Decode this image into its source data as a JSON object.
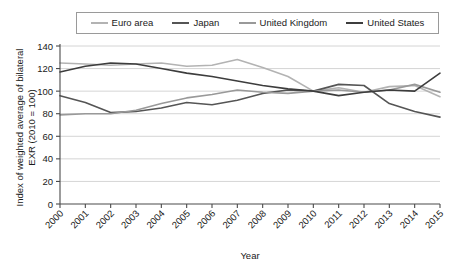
{
  "chart_data": {
    "type": "line",
    "title": "",
    "xlabel": "Year",
    "ylabel": "Index of weighted average of bilateral EXR (2010 = 100)",
    "x": [
      2000,
      2001,
      2002,
      2003,
      2004,
      2005,
      2006,
      2007,
      2008,
      2009,
      2010,
      2011,
      2012,
      2013,
      2014,
      2015
    ],
    "xtick_labels": [
      "2000",
      "2001",
      "2002",
      "2003",
      "2004",
      "2005",
      "2006",
      "2007",
      "2008",
      "2009",
      "2010",
      "2011",
      "2012",
      "2013",
      "2014",
      "2015"
    ],
    "ytick_labels": [
      "0",
      "20",
      "40",
      "60",
      "80",
      "100",
      "120",
      "140"
    ],
    "yticks": [
      0,
      20,
      40,
      60,
      80,
      100,
      120,
      140
    ],
    "ylim": [
      0,
      140
    ],
    "xlim": [
      2000,
      2015
    ],
    "grid": "horizontal",
    "legend_position": "top",
    "series": [
      {
        "name": "Euro area",
        "color": "#b3b3b3",
        "values": [
          125,
          124,
          123,
          124,
          125,
          122,
          123,
          128,
          121,
          113,
          100,
          103,
          99,
          104,
          105,
          95
        ]
      },
      {
        "name": "Japan",
        "color": "#555555",
        "values": [
          96,
          90,
          81,
          82,
          85,
          90,
          88,
          92,
          98,
          101,
          100,
          106,
          105,
          89,
          82,
          77
        ]
      },
      {
        "name": "United Kingdom",
        "color": "#999999",
        "values": [
          79,
          80,
          80,
          83,
          89,
          94,
          97,
          101,
          99,
          98,
          100,
          101,
          99,
          101,
          106,
          99
        ]
      },
      {
        "name": "United States",
        "color": "#3d3d3d",
        "values": [
          117,
          122,
          125,
          124,
          120,
          116,
          113,
          109,
          105,
          102,
          100,
          96,
          99,
          101,
          100,
          116
        ]
      }
    ]
  }
}
